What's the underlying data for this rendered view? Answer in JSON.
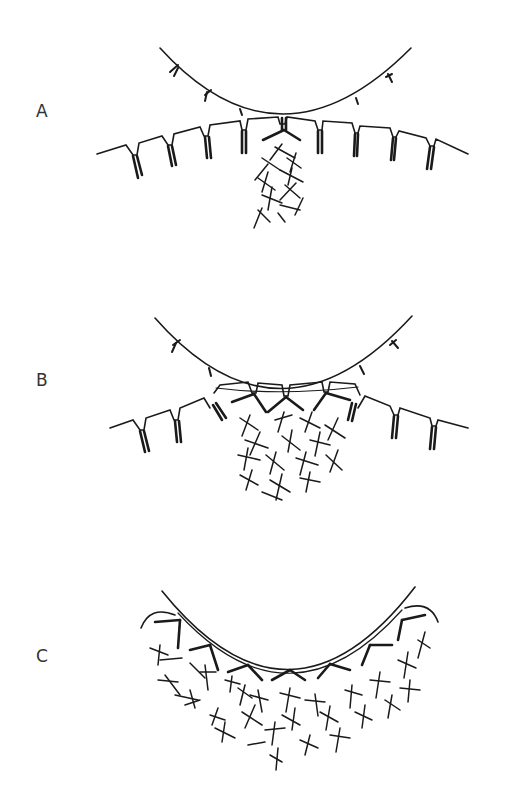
{
  "figure": {
    "panels": [
      {
        "id": "A",
        "label": "A",
        "description": "Upper cell contacts lower cell at a single point; one receptor cluster activated, small local filament network"
      },
      {
        "id": "B",
        "label": "B",
        "description": "Contact zone expands; several receptors engaged; larger filament network below contact"
      },
      {
        "id": "C",
        "label": "C",
        "description": "Lower membrane wraps the upper cell; many receptors engaged; extensive filament meshwork"
      }
    ],
    "colors": {
      "line": "#1a1a1a",
      "background": "#ffffff",
      "label": "#333333"
    }
  }
}
